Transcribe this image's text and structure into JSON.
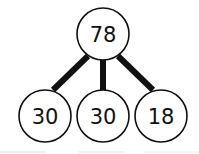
{
  "diagram": {
    "type": "tree",
    "root": {
      "label": "78",
      "cx": 103,
      "cy": 34
    },
    "children": [
      {
        "label": "30",
        "cx": 45,
        "cy": 116
      },
      {
        "label": "30",
        "cx": 103,
        "cy": 116
      },
      {
        "label": "18",
        "cx": 161,
        "cy": 116
      }
    ],
    "node_radius": 26,
    "edge_color": "#111111",
    "node_stroke": "#111111",
    "node_fill": "#ffffff"
  }
}
